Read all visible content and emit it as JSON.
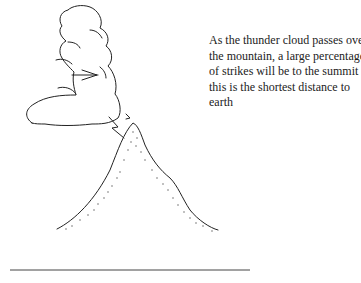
{
  "figure": {
    "caption_lines": [
      "As the thunder cloud passes over",
      "the mountain, a large percentage",
      "of strikes will be to the summit as",
      "this is the shortest distance to",
      "earth"
    ],
    "elements": {
      "cloud": "thunder-cloud",
      "mountain": "mountain-with-stippled-slopes",
      "lightning": "lightning-bolt-to-summit",
      "ground_line": "horizontal-ground-line"
    },
    "colors": {
      "ink": "#222222",
      "background": "#ffffff"
    }
  }
}
